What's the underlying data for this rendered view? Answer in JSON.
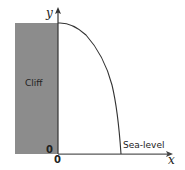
{
  "diagram": {
    "type": "projectile-off-cliff",
    "labels": {
      "y_axis": "y",
      "x_axis": "x",
      "cliff": "Cliff",
      "sea_level": "Sea-level",
      "origin_y": "0",
      "origin_x": "0"
    },
    "colors": {
      "cliff_fill": "#8c8c8c",
      "axis": "#333333",
      "curve": "#333333",
      "sea_line": "#999999"
    }
  }
}
